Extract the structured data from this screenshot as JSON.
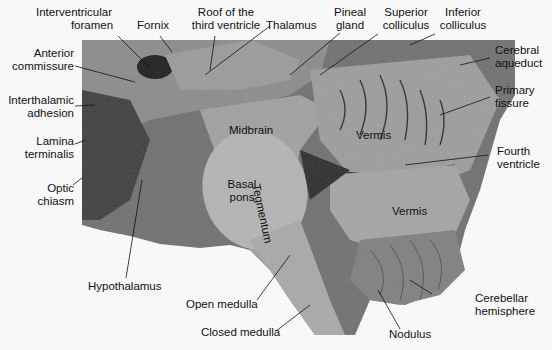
{
  "figure": {
    "outer_labels": [
      {
        "id": "interventricular-foramen",
        "lines": [
          "Interventricular",
          "foramen"
        ]
      },
      {
        "id": "fornix",
        "lines": [
          "Fornix"
        ]
      },
      {
        "id": "roof-third-ventricle",
        "lines": [
          "Roof of the",
          "third ventricle"
        ]
      },
      {
        "id": "thalamus",
        "lines": [
          "Thalamus"
        ]
      },
      {
        "id": "pineal-gland",
        "lines": [
          "Pineal",
          "gland"
        ]
      },
      {
        "id": "superior-colliculus",
        "lines": [
          "Superior",
          "colliculus"
        ]
      },
      {
        "id": "inferior-colliculus",
        "lines": [
          "Inferior",
          "colliculus"
        ]
      },
      {
        "id": "anterior-commissure",
        "lines": [
          "Anterior",
          "commissure"
        ]
      },
      {
        "id": "interthalamic-adhesion",
        "lines": [
          "Interthalamic",
          "adhesion"
        ]
      },
      {
        "id": "lamina-terminalis",
        "lines": [
          "Lamina",
          "terminalis"
        ]
      },
      {
        "id": "optic-chiasm",
        "lines": [
          "Optic",
          "chiasm"
        ]
      },
      {
        "id": "cerebral-aqueduct",
        "lines": [
          "Cerebral",
          "aqueduct"
        ]
      },
      {
        "id": "primary-fissure",
        "lines": [
          "Primary",
          "fissure"
        ]
      },
      {
        "id": "fourth-ventricle",
        "lines": [
          "Fourth",
          "ventricle"
        ]
      },
      {
        "id": "hypothalamus",
        "lines": [
          "Hypothalamus"
        ]
      },
      {
        "id": "open-medulla",
        "lines": [
          "Open medulla"
        ]
      },
      {
        "id": "closed-medulla",
        "lines": [
          "Closed medulla"
        ]
      },
      {
        "id": "nodulus",
        "lines": [
          "Nodulus"
        ]
      },
      {
        "id": "cerebellar-hemisphere",
        "lines": [
          "Cerebellar",
          "hemisphere"
        ]
      }
    ],
    "inner_labels": [
      {
        "id": "midbrain",
        "text": "Midbrain"
      },
      {
        "id": "tegmentum",
        "text": "Tegmentum"
      },
      {
        "id": "basal-pons",
        "lines": [
          "Basal",
          "pons"
        ]
      },
      {
        "id": "vermis-upper",
        "text": "Vermis"
      },
      {
        "id": "vermis-lower",
        "text": "Vermis"
      }
    ]
  }
}
